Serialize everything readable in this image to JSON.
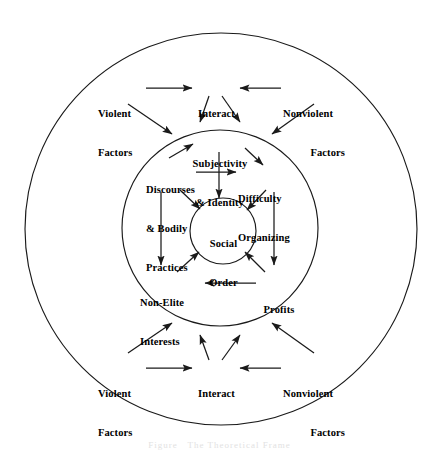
{
  "figure": {
    "caption": "Figure   The Theoretical Frame",
    "stroke_color": "#1a1a1a",
    "text_color": "#000000",
    "background_color": "#ffffff"
  },
  "circles": [
    {
      "name": "outer-ring",
      "cx": 221,
      "cy": 229,
      "r": 196
    },
    {
      "name": "middle-ring",
      "cx": 220,
      "cy": 228,
      "r": 98
    },
    {
      "name": "core",
      "cx": 223,
      "cy": 231,
      "r": 33
    }
  ],
  "nodes": {
    "top_violent": {
      "lines": [
        "Violent",
        "Factors"
      ]
    },
    "top_interact": {
      "lines": [
        "Interact"
      ]
    },
    "top_nonviolent": {
      "lines": [
        "Nonviolent",
        "Factors"
      ]
    },
    "subjectivity": {
      "lines": [
        "Subjectivity",
        "& Identity"
      ]
    },
    "discourses": {
      "lines": [
        "Discourses",
        "& Bodily",
        "Practices"
      ]
    },
    "difficulty": {
      "lines": [
        "Difficulty",
        "Organizing"
      ]
    },
    "social_order": {
      "lines": [
        "Social",
        "Order"
      ]
    },
    "non_elite": {
      "lines": [
        "Non-Elite",
        "Interests"
      ]
    },
    "profits": {
      "lines": [
        "Profits"
      ]
    },
    "bottom_violent": {
      "lines": [
        "Violent",
        "Factors"
      ]
    },
    "bottom_interact": {
      "lines": [
        "Interact"
      ]
    },
    "bottom_nonviolent": {
      "lines": [
        "Nonviolent",
        "Factors"
      ]
    }
  },
  "edges": [
    {
      "from": "top_violent",
      "to": "top_interact",
      "kind": "horizontal"
    },
    {
      "from": "top_nonviolent",
      "to": "top_interact",
      "kind": "horizontal"
    },
    {
      "from": "top_violent",
      "to": "middle-ring",
      "kind": "diagonal"
    },
    {
      "from": "top_nonviolent",
      "to": "middle-ring",
      "kind": "diagonal"
    },
    {
      "from": "top_interact",
      "to": "middle-ring",
      "kind": "fan-left"
    },
    {
      "from": "top_interact",
      "to": "middle-ring",
      "kind": "fan-right"
    },
    {
      "from": "discourses",
      "to": "subjectivity",
      "kind": "diagonal"
    },
    {
      "from": "discourses",
      "to": "difficulty",
      "kind": "horizontal"
    },
    {
      "from": "subjectivity",
      "to": "difficulty",
      "kind": "diagonal"
    },
    {
      "from": "subjectivity",
      "to": "social_order",
      "kind": "vertical"
    },
    {
      "from": "discourses",
      "to": "social_order",
      "kind": "diagonal"
    },
    {
      "from": "difficulty",
      "to": "social_order",
      "kind": "diagonal"
    },
    {
      "from": "discourses",
      "to": "non_elite",
      "kind": "vertical"
    },
    {
      "from": "difficulty",
      "to": "profits",
      "kind": "vertical"
    },
    {
      "from": "profits",
      "to": "non_elite",
      "kind": "horizontal"
    },
    {
      "from": "non_elite",
      "to": "social_order",
      "kind": "diagonal"
    },
    {
      "from": "profits",
      "to": "social_order",
      "kind": "diagonal"
    },
    {
      "from": "bottom_violent",
      "to": "bottom_interact",
      "kind": "horizontal"
    },
    {
      "from": "bottom_nonviolent",
      "to": "bottom_interact",
      "kind": "horizontal"
    },
    {
      "from": "bottom_violent",
      "to": "middle-ring",
      "kind": "diagonal"
    },
    {
      "from": "bottom_nonviolent",
      "to": "middle-ring",
      "kind": "diagonal"
    },
    {
      "from": "bottom_interact",
      "to": "middle-ring",
      "kind": "fan-left"
    },
    {
      "from": "bottom_interact",
      "to": "middle-ring",
      "kind": "fan-right"
    }
  ]
}
